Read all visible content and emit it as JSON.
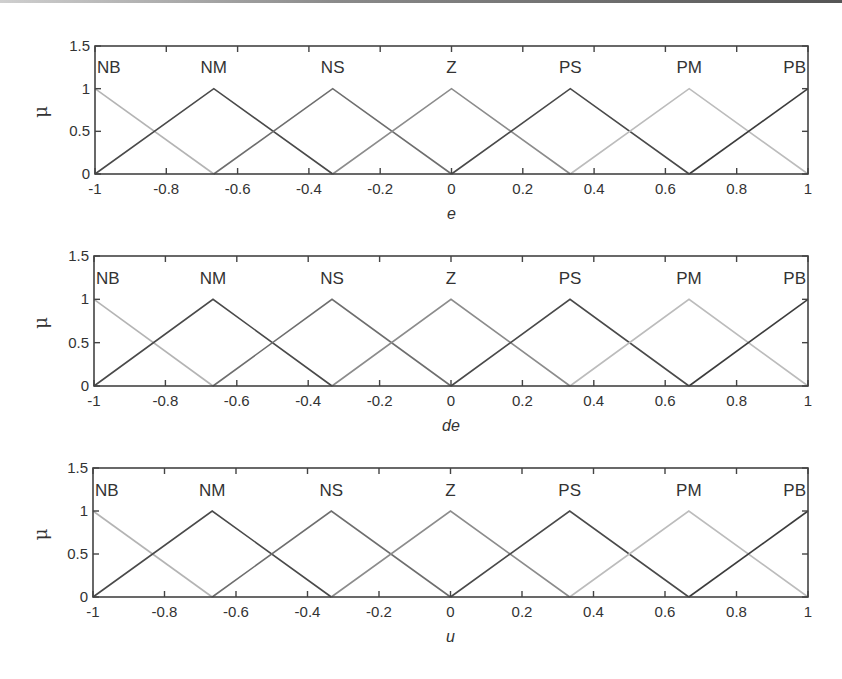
{
  "chart_data": [
    {
      "type": "line",
      "title": "",
      "xlabel": "e",
      "ylabel": "μ",
      "xlim": [
        -1,
        1
      ],
      "ylim": [
        0,
        1.5
      ],
      "xticks": [
        -1,
        -0.8,
        -0.6,
        -0.4,
        -0.2,
        0,
        0.2,
        0.4,
        0.6,
        0.8,
        1
      ],
      "xtick_labels": [
        "-1",
        "-0.8",
        "-0.6",
        "-0.4",
        "-0.2",
        "0",
        "0.2",
        "0.4",
        "0.6",
        "0.8",
        "1"
      ],
      "yticks": [
        0,
        0.5,
        1,
        1.5
      ],
      "ytick_labels": [
        "0",
        "0.5",
        "1",
        "1.5"
      ],
      "grid": false,
      "series": [
        {
          "name": "NB",
          "x": [
            -1,
            -0.6667
          ],
          "y": [
            1,
            0
          ],
          "color": "#b4b4b4"
        },
        {
          "name": "NM",
          "x": [
            -1,
            -0.6667,
            -0.3333
          ],
          "y": [
            0,
            1,
            0
          ],
          "color": "#4a4a4a"
        },
        {
          "name": "NS",
          "x": [
            -0.6667,
            -0.3333,
            0
          ],
          "y": [
            0,
            1,
            0
          ],
          "color": "#6e6e6e"
        },
        {
          "name": "Z",
          "x": [
            -0.3333,
            0,
            0.3333
          ],
          "y": [
            0,
            1,
            0
          ],
          "color": "#8c8c8c"
        },
        {
          "name": "PS",
          "x": [
            0,
            0.3333,
            0.6667
          ],
          "y": [
            0,
            1,
            0
          ],
          "color": "#4a4a4a"
        },
        {
          "name": "PM",
          "x": [
            0.3333,
            0.6667,
            1
          ],
          "y": [
            0,
            1,
            0
          ],
          "color": "#bcbcbc"
        },
        {
          "name": "PB",
          "x": [
            0.6667,
            1
          ],
          "y": [
            0,
            1
          ],
          "color": "#3c3c3c"
        }
      ]
    },
    {
      "type": "line",
      "title": "",
      "xlabel": "de",
      "ylabel": "μ",
      "xlim": [
        -1,
        1
      ],
      "ylim": [
        0,
        1.5
      ],
      "xticks": [
        -1,
        -0.8,
        -0.6,
        -0.4,
        -0.2,
        0,
        0.2,
        0.4,
        0.6,
        0.8,
        1
      ],
      "xtick_labels": [
        "-1",
        "-0.8",
        "-0.6",
        "-0.4",
        "-0.2",
        "0",
        "0.2",
        "0.4",
        "0.6",
        "0.8",
        "1"
      ],
      "yticks": [
        0,
        0.5,
        1,
        1.5
      ],
      "ytick_labels": [
        "0",
        "0.5",
        "1",
        "1.5"
      ],
      "grid": false,
      "series": [
        {
          "name": "NB",
          "x": [
            -1,
            -0.6667
          ],
          "y": [
            1,
            0
          ],
          "color": "#b4b4b4"
        },
        {
          "name": "NM",
          "x": [
            -1,
            -0.6667,
            -0.3333
          ],
          "y": [
            0,
            1,
            0
          ],
          "color": "#4a4a4a"
        },
        {
          "name": "NS",
          "x": [
            -0.6667,
            -0.3333,
            0
          ],
          "y": [
            0,
            1,
            0
          ],
          "color": "#6e6e6e"
        },
        {
          "name": "Z",
          "x": [
            -0.3333,
            0,
            0.3333
          ],
          "y": [
            0,
            1,
            0
          ],
          "color": "#8c8c8c"
        },
        {
          "name": "PS",
          "x": [
            0,
            0.3333,
            0.6667
          ],
          "y": [
            0,
            1,
            0
          ],
          "color": "#4a4a4a"
        },
        {
          "name": "PM",
          "x": [
            0.3333,
            0.6667,
            1
          ],
          "y": [
            0,
            1,
            0
          ],
          "color": "#bcbcbc"
        },
        {
          "name": "PB",
          "x": [
            0.6667,
            1
          ],
          "y": [
            0,
            1
          ],
          "color": "#3c3c3c"
        }
      ]
    },
    {
      "type": "line",
      "title": "",
      "xlabel": "u",
      "ylabel": "μ",
      "xlim": [
        -1,
        1
      ],
      "ylim": [
        0,
        1.5
      ],
      "xticks": [
        -1,
        -0.8,
        -0.6,
        -0.4,
        -0.2,
        0,
        0.2,
        0.4,
        0.6,
        0.8,
        1
      ],
      "xtick_labels": [
        "-1",
        "-0.8",
        "-0.6",
        "-0.4",
        "-0.2",
        "0",
        "0.2",
        "0.4",
        "0.6",
        "0.8",
        "1"
      ],
      "yticks": [
        0,
        0.5,
        1,
        1.5
      ],
      "ytick_labels": [
        "0",
        "0.5",
        "1",
        "1.5"
      ],
      "grid": false,
      "series": [
        {
          "name": "NB",
          "x": [
            -1,
            -0.6667
          ],
          "y": [
            1,
            0
          ],
          "color": "#b4b4b4"
        },
        {
          "name": "NM",
          "x": [
            -1,
            -0.6667,
            -0.3333
          ],
          "y": [
            0,
            1,
            0
          ],
          "color": "#4a4a4a"
        },
        {
          "name": "NS",
          "x": [
            -0.6667,
            -0.3333,
            0
          ],
          "y": [
            0,
            1,
            0
          ],
          "color": "#6e6e6e"
        },
        {
          "name": "Z",
          "x": [
            -0.3333,
            0,
            0.3333
          ],
          "y": [
            0,
            1,
            0
          ],
          "color": "#8c8c8c"
        },
        {
          "name": "PS",
          "x": [
            0,
            0.3333,
            0.6667
          ],
          "y": [
            0,
            1,
            0
          ],
          "color": "#4a4a4a"
        },
        {
          "name": "PM",
          "x": [
            0.3333,
            0.6667,
            1
          ],
          "y": [
            0,
            1,
            0
          ],
          "color": "#bcbcbc"
        },
        {
          "name": "PB",
          "x": [
            0.6667,
            1
          ],
          "y": [
            0,
            1
          ],
          "color": "#3c3c3c"
        }
      ]
    }
  ],
  "layout": {
    "frame_color": "#444444",
    "panels": [
      {
        "left": 95,
        "right": 808,
        "top": 46,
        "bottom": 174
      },
      {
        "left": 94,
        "right": 808,
        "top": 256,
        "bottom": 386
      },
      {
        "left": 93,
        "right": 808,
        "top": 468,
        "bottom": 597
      }
    ]
  }
}
